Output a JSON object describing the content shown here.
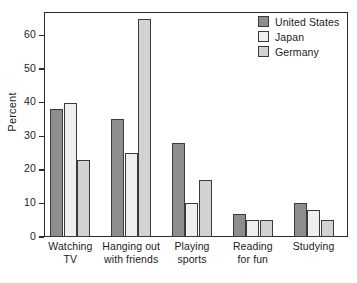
{
  "chart_data": {
    "type": "bar",
    "title": "",
    "subtitle": "",
    "xlabel": "",
    "ylabel": "Percent",
    "ylim": [
      0,
      67
    ],
    "grid": false,
    "legend_position": "top-right-inside",
    "y_ticks": [
      0,
      10,
      20,
      30,
      40,
      50,
      60
    ],
    "categories": [
      "Watching\nTV",
      "Hanging out\nwith friends",
      "Playing\nsports",
      "Reading\nfor fun",
      "Studying"
    ],
    "category_lines": [
      [
        "Watching",
        "TV"
      ],
      [
        "Hanging out",
        "with friends"
      ],
      [
        "Playing",
        "sports"
      ],
      [
        "Reading",
        "for fun"
      ],
      [
        "Studying"
      ]
    ],
    "series": [
      {
        "name": "United States",
        "color": "#8d8d8d",
        "values": [
          38,
          35,
          28,
          7,
          10
        ]
      },
      {
        "name": "Japan",
        "color": "#efefef",
        "values": [
          40,
          25,
          10,
          5,
          8
        ]
      },
      {
        "name": "Germany",
        "color": "#d2d2d2",
        "values": [
          23,
          65,
          17,
          5,
          5
        ]
      }
    ]
  },
  "axis": {
    "y_title": "Percent",
    "tick_0": "0",
    "tick_10": "10",
    "tick_20": "20",
    "tick_30": "30",
    "tick_40": "40",
    "tick_50": "50",
    "tick_60": "60"
  },
  "legend": {
    "items": [
      {
        "label": "United States"
      },
      {
        "label": "Japan"
      },
      {
        "label": "Germany"
      }
    ]
  },
  "colors": {
    "united_states": "#8d8d8d",
    "japan": "#efefef",
    "germany": "#d2d2d2",
    "outline": "#3a3a3a",
    "axis": "#2b2b2b",
    "text": "#1c1c1c",
    "background": "#ffffff"
  }
}
